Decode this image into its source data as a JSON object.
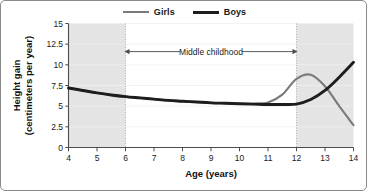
{
  "legend": {
    "position": "top-center",
    "entries": [
      {
        "label": "Girls",
        "color": "#7a7a7a",
        "name": "legend-girls"
      },
      {
        "label": "Boys",
        "color": "#1d1d1d",
        "name": "legend-boys"
      }
    ]
  },
  "annotation": {
    "label": "Middle childhood",
    "from_age": 6,
    "to_age": 12,
    "arrow": "double-headed"
  },
  "shading": {
    "color": "#e4e4e4",
    "bands": [
      [
        4,
        6
      ],
      [
        12,
        14
      ]
    ]
  },
  "chart_data": {
    "type": "line",
    "title": "",
    "subtitle": "",
    "xlabel": "Age (years)",
    "ylabel": "Height gain\n(centimeters per year)",
    "ylabel_line1": "Height gain",
    "ylabel_line2": "(centimeters per year)",
    "xlim": [
      4,
      14
    ],
    "ylim": [
      0,
      15
    ],
    "xticks": [
      4,
      5,
      6,
      7,
      8,
      9,
      10,
      11,
      12,
      13,
      14
    ],
    "xtick_labels": [
      "4",
      "5",
      "6",
      "7",
      "8",
      "9",
      "10",
      "11",
      "12",
      "13",
      "14"
    ],
    "yticks": [
      0,
      2.5,
      5,
      7.5,
      10,
      12.5,
      15
    ],
    "ytick_labels": [
      "0",
      "2.5",
      "5",
      "7.5",
      "10",
      "12.5",
      "15"
    ],
    "grid": "horizontal-faint",
    "legend": "top-center",
    "x": [
      4,
      4.5,
      5,
      5.5,
      6,
      6.5,
      7,
      7.5,
      8,
      8.5,
      9,
      9.5,
      10,
      10.5,
      11,
      11.5,
      12,
      12.5,
      13,
      13.5,
      14
    ],
    "series": [
      {
        "name": "Girls",
        "color": "#7a7a7a",
        "width": 2.1,
        "values": [
          7.2,
          6.9,
          6.6,
          6.35,
          6.15,
          6.0,
          5.85,
          5.7,
          5.6,
          5.5,
          5.4,
          5.35,
          5.3,
          5.3,
          5.45,
          6.4,
          8.3,
          8.8,
          7.4,
          5.0,
          2.7
        ]
      },
      {
        "name": "Boys",
        "color": "#1d1d1d",
        "width": 2.9,
        "values": [
          7.2,
          6.9,
          6.6,
          6.35,
          6.15,
          6.0,
          5.85,
          5.7,
          5.6,
          5.5,
          5.4,
          5.35,
          5.3,
          5.25,
          5.2,
          5.2,
          5.25,
          5.8,
          6.9,
          8.5,
          10.3
        ]
      }
    ],
    "annotations": [
      {
        "text": "Middle childhood",
        "x_from": 6,
        "x_to": 12,
        "y": 11.6
      }
    ]
  }
}
